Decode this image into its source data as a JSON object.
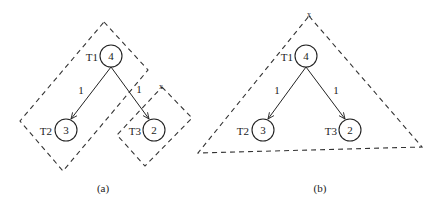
{
  "diagram": {
    "type": "tree-partition",
    "panels": [
      {
        "id": "a",
        "caption": "(a)",
        "nodes": [
          {
            "id": "T1",
            "label": "T1",
            "value": "4"
          },
          {
            "id": "T2",
            "label": "T2",
            "value": "3"
          },
          {
            "id": "T3",
            "label": "T3",
            "value": "2"
          }
        ],
        "edges": [
          {
            "from": "T1",
            "to": "T2",
            "weight": "1"
          },
          {
            "from": "T1",
            "to": "T3",
            "weight": "1"
          }
        ],
        "groups": [
          {
            "name": "T1-T2 cluster",
            "members": [
              "T1",
              "T2"
            ],
            "shape": "dashed-rectangle"
          },
          {
            "name": "T3 cluster",
            "members": [
              "T3"
            ],
            "shape": "dashed-rectangle",
            "mark": "x"
          }
        ]
      },
      {
        "id": "b",
        "caption": "(b)",
        "nodes": [
          {
            "id": "T1",
            "label": "T1",
            "value": "4"
          },
          {
            "id": "T2",
            "label": "T2",
            "value": "3"
          },
          {
            "id": "T3",
            "label": "T3",
            "value": "2"
          }
        ],
        "edges": [
          {
            "from": "T1",
            "to": "T2",
            "weight": "1"
          },
          {
            "from": "T1",
            "to": "T3",
            "weight": "1"
          }
        ],
        "groups": [
          {
            "name": "whole tree",
            "members": [
              "T1",
              "T2",
              "T3"
            ],
            "shape": "dashed-triangle",
            "mark": "x"
          }
        ]
      }
    ]
  },
  "a": {
    "caption": "(a)",
    "t1_label": "T1",
    "t1_value": "4",
    "t2_label": "T2",
    "t2_value": "3",
    "t3_label": "T3",
    "t3_value": "2",
    "edge_left_weight": "1",
    "edge_right_weight": "1",
    "t3_group_mark": "x"
  },
  "b": {
    "caption": "(b)",
    "t1_label": "T1",
    "t1_value": "4",
    "t2_label": "T2",
    "t2_value": "3",
    "t3_label": "T3",
    "t3_value": "2",
    "edge_left_weight": "1",
    "edge_right_weight": "1",
    "apex_mark": "x"
  },
  "colors": {
    "stroke": "#222222",
    "background": "#ffffff"
  }
}
